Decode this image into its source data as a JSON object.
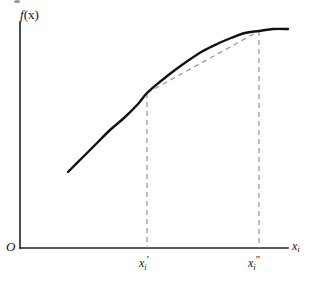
{
  "figure": {
    "type": "mathematical-diagram",
    "background_color": "#ffffff",
    "axis_color": "#222222",
    "curve_color": "#111111",
    "dashed_color": "#8a8a8a"
  },
  "labels": {
    "y_axis": "f(x)",
    "y_axis_italic_part": "f",
    "y_axis_paren_part": "(x)",
    "origin": "O",
    "x_axis": "x",
    "x_axis_subscript": "i",
    "tick1_base": "x",
    "tick1_subscript": "i",
    "tick1_prime": "′",
    "tick2_base": "x",
    "tick2_subscript": "i",
    "tick2_prime": "″"
  },
  "chart_data": {
    "type": "line",
    "title": "",
    "xlabel": "x_i",
    "ylabel": "f(x)",
    "grid": false,
    "legend": "none",
    "axes": {
      "y_axis_x": 20,
      "y_axis_top": 22,
      "y_axis_bottom": 248,
      "x_axis_y": 248,
      "x_axis_left": 20,
      "x_axis_right": 288,
      "origin_px": [
        20,
        248
      ]
    },
    "series": [
      {
        "name": "f(x) concave curve",
        "style": "solid",
        "width": 2.4,
        "points": [
          [
            68,
            172
          ],
          [
            82,
            158
          ],
          [
            96,
            144
          ],
          [
            110,
            130
          ],
          [
            124,
            118
          ],
          [
            138,
            104
          ],
          [
            147,
            93
          ],
          [
            161,
            81
          ],
          [
            175,
            70
          ],
          [
            189,
            60
          ],
          [
            203,
            51
          ],
          [
            217,
            44
          ],
          [
            231,
            38
          ],
          [
            245,
            33
          ],
          [
            259,
            31
          ],
          [
            273,
            29
          ],
          [
            288,
            29
          ]
        ]
      },
      {
        "name": "secant chord",
        "style": "dashed",
        "width": 1,
        "points": [
          [
            147,
            93
          ],
          [
            259,
            31
          ]
        ]
      }
    ],
    "markers": [
      {
        "name": "x_i_prime",
        "label": "x_i'",
        "x_px": 147,
        "curve_y_px": 93,
        "dashed_drop_from": 93,
        "dashed_drop_to": 248
      },
      {
        "name": "x_i_double_prime",
        "label": "x_i''",
        "x_px": 259,
        "curve_y_px": 31,
        "dashed_drop_from": 31,
        "dashed_drop_to": 248
      }
    ]
  }
}
